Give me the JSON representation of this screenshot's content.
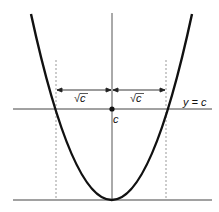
{
  "diagram": {
    "labels": {
      "left_width": "√c",
      "right_width": "√c",
      "intercept": "c",
      "line": "y = c"
    },
    "colors": {
      "curve": "#111111",
      "axes": "#444444",
      "dashed": "#999999"
    }
  }
}
